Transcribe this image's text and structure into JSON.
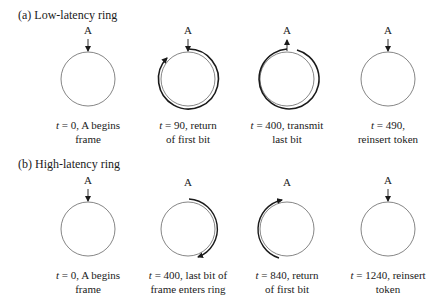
{
  "figure": {
    "panels": [
      {
        "id": "a",
        "title": "(a) Low-latency ring",
        "node_label": "A",
        "stages": [
          {
            "t_var": "t",
            "caption_line1": " = 0, A begins",
            "caption_line2": "frame",
            "arc": "none",
            "node_arrow": "in"
          },
          {
            "t_var": "t",
            "caption_line1": " = 90, return",
            "caption_line2": "of first bit",
            "arc": "full-clockwise-return",
            "node_arrow": "in"
          },
          {
            "t_var": "t",
            "caption_line1": " = 400, transmit",
            "caption_line2": "last bit",
            "arc": "full-with-gap",
            "node_arrow": "out"
          },
          {
            "t_var": "t",
            "caption_line1": " = 490,",
            "caption_line2": "reinsert token",
            "arc": "none",
            "node_arrow": "in"
          }
        ]
      },
      {
        "id": "b",
        "title": "(b) High-latency ring",
        "node_label": "A",
        "stages": [
          {
            "t_var": "t",
            "caption_line1": " = 0, A begins",
            "caption_line2": "frame",
            "arc": "none",
            "node_arrow": "in"
          },
          {
            "t_var": "t",
            "caption_line1": " = 400, last bit of",
            "caption_line2": "frame enters ring",
            "arc": "right-half",
            "node_arrow": "none"
          },
          {
            "t_var": "t",
            "caption_line1": " = 840, return",
            "caption_line2": "of first bit",
            "arc": "left-half",
            "node_arrow": "none"
          },
          {
            "t_var": "t",
            "caption_line1": " = 1240, reinsert",
            "caption_line2": "token",
            "arc": "none",
            "node_arrow": "in"
          }
        ]
      }
    ]
  }
}
